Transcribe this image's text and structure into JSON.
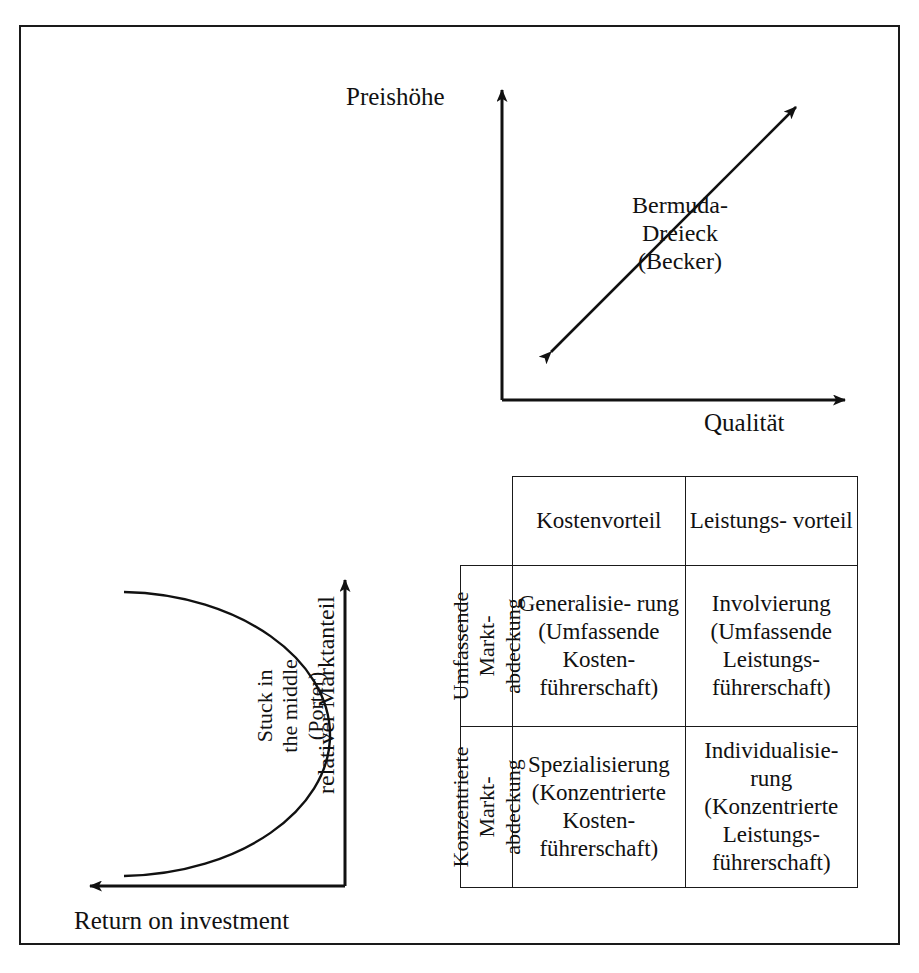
{
  "figure": {
    "type": "diagram"
  },
  "price_quality_chart": {
    "y_axis_label": "Preishöhe",
    "x_axis_label": "Qualität",
    "annotation": "Bermuda-\nDreieck\n(Becker)",
    "annotation_lines": [
      "Bermuda-",
      "Dreieck",
      "(Becker)"
    ],
    "arrow": "double-headed diagonal arrow from lower-left to upper-right"
  },
  "roi_chart": {
    "y_axis_label": "relativer Marktanteil",
    "x_axis_label": "Return on investment",
    "curve_label": "Stuck in\nthe middle\n(Porter)",
    "curve_label_lines": [
      "Stuck in",
      "the middle",
      "(Porter)"
    ],
    "curve": "U-shaped (parabolic) curve opening to the left"
  },
  "matrix": {
    "corner_label": "",
    "column_headers": [
      "Kostenvorteil",
      "Leistungs-\nvorteil"
    ],
    "row_headers": [
      "Umfassende\nMarkt-\nabdeckung",
      "Konzentrierte\nMarkt-\nabdeckung"
    ],
    "cells": [
      [
        "Generalisie-\nrung\n(Umfassende\nKosten-\nführerschaft)",
        "Involvierung\n(Umfassende\nLeistungs-\nführerschaft)"
      ],
      [
        "Spezialisierung\n(Konzentrierte\nKosten-\nführerschaft)",
        "Individualisie-\nrung\n(Konzentrierte\nLeistungs-\nführerschaft)"
      ]
    ]
  },
  "colors": {
    "ink": "#111111",
    "border": "#1a1a1a",
    "background": "#ffffff"
  }
}
